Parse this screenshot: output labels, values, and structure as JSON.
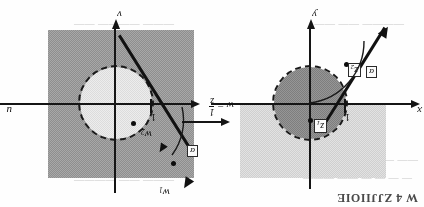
{
  "figure": {
    "orientation_note": "upside-down-scan",
    "caption_fragment_top_right": "W 4 ZJJIIOIE",
    "transform_label": {
      "lhs": "w",
      "equals": "=",
      "numerator": "1",
      "denominator": "z"
    },
    "panels": [
      {
        "id": "w-plane",
        "name": "w-plane",
        "axis_horizontal_label": "u",
        "axis_vertical_label": "v",
        "unit_tick_label": "1",
        "angle_label": "α",
        "points": [
          {
            "id": "w1",
            "base": "w",
            "sub": "1"
          },
          {
            "id": "w2",
            "base": "w",
            "sub": "2"
          }
        ]
      },
      {
        "id": "z-plane",
        "name": "z-plane",
        "axis_horizontal_label": "x",
        "axis_vertical_label": "y",
        "unit_tick_label": "1",
        "angle_label": "α",
        "points": [
          {
            "id": "z1",
            "base": "z",
            "sub": "1"
          },
          {
            "id": "z2",
            "base": "z",
            "sub": "2"
          }
        ]
      }
    ],
    "colors": {
      "ink": "#121212",
      "halfplane_dark": "#9b9b9b",
      "halfplane_light": "#dcdcdc",
      "disk_light": "#e4e4e4",
      "disk_mid": "#8a8a8a",
      "paper": "#fefefe",
      "ghost_text": "#c8c8c8"
    },
    "ghost_text": [
      {
        "id": "g1",
        "text": "— — — —  —— ———"
      },
      {
        "id": "g2",
        "text": "—— —— ———  ——"
      },
      {
        "id": "g3",
        "text": "——— —— ————"
      },
      {
        "id": "g4",
        "text": "—— ——— ———"
      },
      {
        "id": "g5",
        "text": "———— —— ——"
      },
      {
        "id": "g6",
        "text": "——— ———— ——"
      }
    ]
  }
}
